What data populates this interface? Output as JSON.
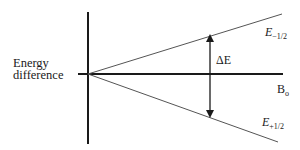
{
  "diagram": {
    "y_axis_label_line1": "Energy",
    "y_axis_label_line2": "difference",
    "x_axis_label_main": "B",
    "x_axis_label_sub": "o",
    "upper_level": {
      "symbol": "E",
      "subscript": "−1/2"
    },
    "lower_level": {
      "symbol": "E",
      "subscript": "+1/2"
    },
    "gap_label": "ΔE",
    "colors": {
      "axis": "#1a1a1a",
      "line": "#555555",
      "text": "#1a1a1a"
    }
  }
}
